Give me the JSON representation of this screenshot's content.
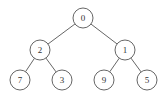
{
  "diagram": {
    "type": "binary-tree",
    "nodes": [
      {
        "id": "n0",
        "label": "0"
      },
      {
        "id": "n2",
        "label": "2"
      },
      {
        "id": "n1",
        "label": "1"
      },
      {
        "id": "n7",
        "label": "7"
      },
      {
        "id": "n3",
        "label": "3"
      },
      {
        "id": "n9",
        "label": "9"
      },
      {
        "id": "n5",
        "label": "5"
      }
    ],
    "edges": [
      {
        "from": "n0",
        "to": "n2"
      },
      {
        "from": "n0",
        "to": "n1"
      },
      {
        "from": "n2",
        "to": "n7"
      },
      {
        "from": "n2",
        "to": "n3"
      },
      {
        "from": "n1",
        "to": "n9"
      },
      {
        "from": "n1",
        "to": "n5"
      }
    ],
    "colors": {
      "stroke": "#555555",
      "text": "#333333",
      "fill": "#ffffff"
    }
  }
}
